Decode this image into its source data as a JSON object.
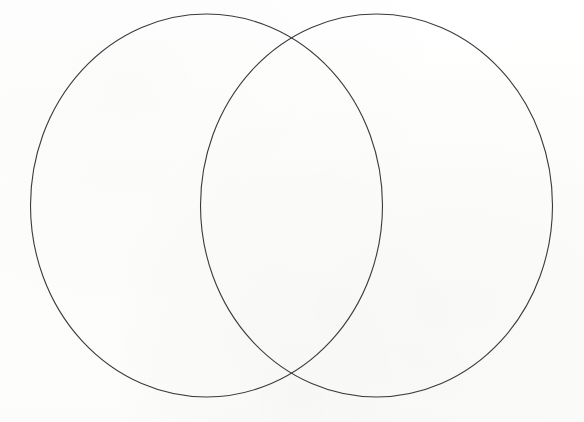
{
  "page": {
    "width": 584,
    "height": 422,
    "background_color": "#fdfdfc"
  },
  "diagram": {
    "type": "venn",
    "set_count": 2,
    "labels_visible": false,
    "region_labels": [],
    "stroke_color": "#3a3a3a",
    "stroke_width": 1.1,
    "fill": "none",
    "circles": [
      {
        "name": "left-set",
        "cx": 206.5,
        "cy": 205.5,
        "rx": 176,
        "ry": 191.5,
        "label": ""
      },
      {
        "name": "right-set",
        "cx": 376.5,
        "cy": 205.5,
        "rx": 176,
        "ry": 191.5,
        "label": ""
      }
    ],
    "intersection_points": [
      {
        "name": "upper-crossing",
        "x": 292,
        "y": 40
      },
      {
        "name": "lower-crossing",
        "x": 292,
        "y": 382
      }
    ]
  }
}
